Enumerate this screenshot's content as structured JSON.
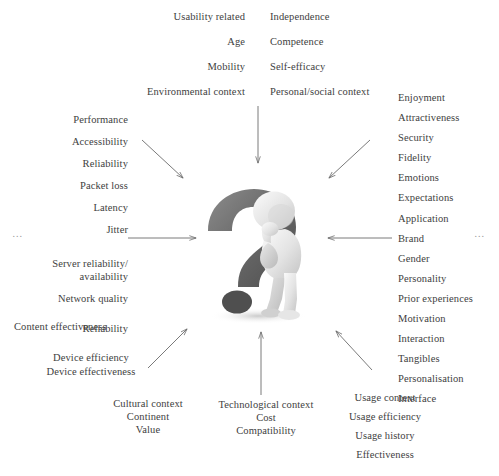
{
  "diagram": {
    "center": {
      "icon": "question-mark-with-thinking-person",
      "question_mark_color": "#6e6e6e",
      "figure_color": "#e8e8e8"
    },
    "ellipsis_left": "…",
    "ellipsis_right": "…",
    "clusters": {
      "top_left": {
        "name": "user-characteristics-context",
        "items": [
          "Usability related",
          "Age",
          "Mobility",
          "Environmental context"
        ]
      },
      "top_right": {
        "name": "personal-social-factors",
        "items": [
          "Independence",
          "Competence",
          "Self-efficacy",
          "Personal/social context"
        ]
      },
      "left": {
        "name": "network-service-quality",
        "items": [
          "Performance",
          "Accessibility",
          "Reliability",
          "Packet loss",
          "Latency",
          "Jitter",
          "Server reliability/",
          "availability",
          "Network quality",
          "Reliability"
        ]
      },
      "right": {
        "name": "product-experience-factors",
        "items": [
          "Enjoyment",
          "Attractiveness",
          "Security",
          "Fidelity",
          "Emotions",
          "Expectations",
          "Application",
          "Brand",
          "Gender",
          "Personality",
          "Prior experiences",
          "Motivation",
          "Interaction",
          "Tangibles",
          "Personalisation",
          "Interface"
        ]
      },
      "bottom_left_a": {
        "name": "content-effectiveness",
        "items": [
          "Content effectiveness"
        ]
      },
      "bottom_left_b": {
        "name": "device-factors",
        "items": [
          "Device efficiency",
          "Device effectiveness"
        ]
      },
      "bottom_cultural": {
        "name": "cultural-context",
        "items": [
          "Cultural context",
          "Continent",
          "Value"
        ]
      },
      "bottom_center": {
        "name": "technological-context",
        "items": [
          "Technological context",
          "Cost",
          "Compatibility"
        ]
      },
      "bottom_right": {
        "name": "usage-factors",
        "items": [
          "Usage context",
          "Usage efficiency",
          "Usage history",
          "Effectiveness"
        ]
      }
    },
    "arrows": [
      {
        "name": "arrow-from-top-left",
        "direction": "down-right"
      },
      {
        "name": "arrow-from-top-center",
        "direction": "down"
      },
      {
        "name": "arrow-from-top-right",
        "direction": "down-left"
      },
      {
        "name": "arrow-from-left",
        "direction": "right"
      },
      {
        "name": "arrow-from-right",
        "direction": "left"
      },
      {
        "name": "arrow-from-bottom-left",
        "direction": "up-right"
      },
      {
        "name": "arrow-from-bottom-center",
        "direction": "up"
      },
      {
        "name": "arrow-from-bottom-right",
        "direction": "up-left"
      }
    ],
    "colors": {
      "text": "#3e3e3e",
      "arrow": "#6b6b6b",
      "background": "#ffffff"
    }
  }
}
